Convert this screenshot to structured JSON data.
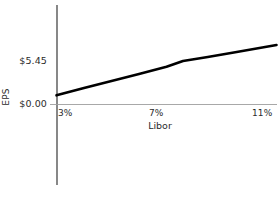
{
  "chart_data": {
    "type": "line",
    "title": "",
    "subtitle": "",
    "xlabel": "Libor",
    "ylabel": "EPS",
    "grid": false,
    "legend": false,
    "legend_position": "none",
    "xtick_labels": [
      "3%",
      "7%",
      "11%"
    ],
    "xtick_values": [
      3,
      7,
      11
    ],
    "ytick_labels": [
      "$0.00",
      "$5.45"
    ],
    "ytick_values": [
      0.0,
      5.45
    ],
    "xlim": [
      3,
      11
    ],
    "ylim": [
      0,
      10.9
    ],
    "line_color": "#000000",
    "axis_color": "#555555",
    "xaxis_color": "#9a9a9a",
    "background_color": "#ffffff",
    "series": [
      {
        "name": "EPS vs Libor",
        "x": [
          3.0,
          4.0,
          5.0,
          6.0,
          7.0,
          7.6,
          8.5,
          9.5,
          11.0
        ],
        "values": [
          1.15,
          2.08,
          2.95,
          3.82,
          4.72,
          5.45,
          5.95,
          6.55,
          7.45
        ]
      }
    ],
    "annotations": []
  },
  "axes": {
    "y_label_upper": "$5.45",
    "y_label_lower": "$0.00",
    "y_axis_title": "EPS",
    "x_label_left": "3%",
    "x_label_mid": "7%",
    "x_label_right": "11%",
    "x_axis_title": "Libor"
  }
}
